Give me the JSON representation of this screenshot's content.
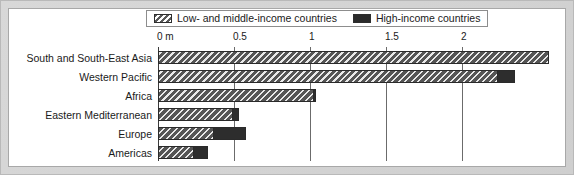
{
  "chart_data": {
    "type": "bar",
    "orientation": "horizontal",
    "stacked": true,
    "title": "",
    "xlabel": "0 m",
    "ylabel": "",
    "xlim": [
      0,
      2.573
    ],
    "grid": true,
    "legend_position": "top",
    "categories": [
      "South and South-East Asia",
      "Western Pacific",
      "Africa",
      "Eastern Mediterranean",
      "Europe",
      "Americas"
    ],
    "series": [
      {
        "name": "Low- and middle-income countries",
        "pattern": "diagonal-hatch",
        "color": "#636363",
        "values": [
          2.57,
          2.23,
          1.02,
          0.49,
          0.36,
          0.23
        ]
      },
      {
        "name": "High-income countries",
        "pattern": "solid",
        "color": "#2d2d2d",
        "values": [
          0.0,
          0.12,
          0.02,
          0.04,
          0.22,
          0.1
        ]
      }
    ],
    "xticks": [
      {
        "value": 0,
        "label": "0 m"
      },
      {
        "value": 0.5,
        "label": "0.5"
      },
      {
        "value": 1,
        "label": "1"
      },
      {
        "value": 1.5,
        "label": "1.5"
      },
      {
        "value": 2,
        "label": "2"
      }
    ]
  },
  "legend": {
    "entries": [
      {
        "label": "Low- and middle-income countries",
        "swatch": "hatch-swatch-icon"
      },
      {
        "label": "High-income countries",
        "swatch": "solid-swatch-icon"
      }
    ]
  }
}
